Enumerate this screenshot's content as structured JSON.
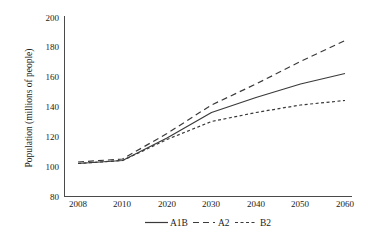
{
  "chart_data": {
    "type": "line",
    "title": "",
    "xlabel": "",
    "ylabel": "Population (millions of people)",
    "categories": [
      "2008",
      "2010",
      "2020",
      "2030",
      "2040",
      "2050",
      "2060"
    ],
    "x_tick_labels": [
      "2008",
      "2010",
      "2020",
      "2030",
      "2040",
      "2050",
      "2060"
    ],
    "y_tick_labels": [
      "80",
      "100",
      "120",
      "140",
      "160",
      "180",
      "200"
    ],
    "y_ticks": [
      80,
      100,
      120,
      140,
      160,
      180,
      200
    ],
    "ylim": [
      80,
      200
    ],
    "grid": false,
    "legend_position": "bottom-center",
    "series": [
      {
        "name": "A1B",
        "style": "solid",
        "color": "#3a3a3a",
        "values": [
          102,
          104,
          119,
          136,
          146,
          155,
          162
        ]
      },
      {
        "name": "A2",
        "style": "long-dashed",
        "color": "#3a3a3a",
        "values": [
          103,
          105,
          122,
          141,
          155,
          170,
          184
        ]
      },
      {
        "name": "B2",
        "style": "short-dashed",
        "color": "#3a3a3a",
        "values": [
          102,
          104,
          118,
          130,
          136,
          141,
          144
        ]
      }
    ],
    "legend": [
      {
        "label": "A1B",
        "style": "solid"
      },
      {
        "label": "A2",
        "style": "long-dashed"
      },
      {
        "label": "B2",
        "style": "short-dashed"
      }
    ]
  },
  "axes": {
    "y_axis_title": "Population (millions of people)"
  }
}
